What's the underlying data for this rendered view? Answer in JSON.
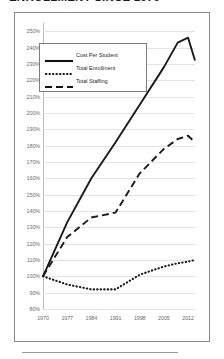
{
  "title": "ENROLLMENT SINCE 1970",
  "colors": {
    "line": "#1a1a1a",
    "grid": "#e3e3e3",
    "axis_text": "#6b6b6b",
    "frame": "#8a8a8a"
  },
  "legend": {
    "items": [
      {
        "label": "Cost Per Student",
        "style": "solid",
        "swatch": "solid-line-swatch"
      },
      {
        "label": "Total Enrollment",
        "style": "dotted",
        "swatch": "dotted-line-swatch"
      },
      {
        "label": "Total Staffing",
        "style": "dashed",
        "swatch": "dashed-line-swatch"
      }
    ]
  },
  "chart_data": {
    "type": "line",
    "title": "ENROLLMENT SINCE 1970",
    "xlabel": "",
    "ylabel": "",
    "xlim": [
      1970,
      2014
    ],
    "ylim": [
      80,
      255
    ],
    "grid": true,
    "legend_position": "upper-left-inside",
    "ytick_labels": [
      "250%",
      "240%",
      "230%",
      "220%",
      "210%",
      "200%",
      "190%",
      "180%",
      "170%",
      "160%",
      "150%",
      "140%",
      "130%",
      "120%",
      "110%",
      "100%",
      "90%",
      "80%"
    ],
    "ytick_values": [
      250,
      240,
      230,
      220,
      210,
      200,
      190,
      180,
      170,
      160,
      150,
      140,
      130,
      120,
      110,
      100,
      90,
      80
    ],
    "xtick_labels": [
      "1970",
      "1977",
      "1984",
      "1991",
      "1998",
      "2005",
      "2012"
    ],
    "xtick_values": [
      1970,
      1977,
      1984,
      1991,
      1998,
      2005,
      2012
    ],
    "x": [
      1970,
      1977,
      1984,
      1991,
      1998,
      2005,
      2009,
      2012,
      2014
    ],
    "series": [
      {
        "name": "Cost Per Student",
        "style": "solid",
        "values": [
          100,
          133,
          160,
          182,
          205,
          228,
          243,
          246,
          232
        ]
      },
      {
        "name": "Total Enrollment",
        "style": "dotted",
        "values": [
          100,
          95,
          92,
          92,
          101,
          106,
          108,
          109,
          110
        ]
      },
      {
        "name": "Total Staffing",
        "style": "dashed",
        "values": [
          100,
          124,
          136,
          139,
          163,
          178,
          184,
          186,
          182
        ]
      }
    ]
  }
}
